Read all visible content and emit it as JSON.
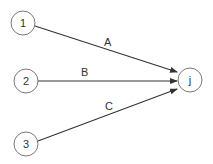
{
  "diagram": {
    "type": "network-activity-diagram",
    "colors": {
      "node_stroke": "#777777",
      "edge": "#333333",
      "text": "#333333",
      "background": "#ffffff"
    },
    "nodes": [
      {
        "id": "1",
        "label": "1",
        "cx": 23,
        "cy": 23,
        "r": 12
      },
      {
        "id": "2",
        "label": "2",
        "cx": 26,
        "cy": 81,
        "r": 12
      },
      {
        "id": "3",
        "label": "3",
        "cx": 26,
        "cy": 144,
        "r": 12
      },
      {
        "id": "j",
        "label": "j",
        "cx": 190,
        "cy": 80,
        "r": 12
      }
    ],
    "edges": [
      {
        "from": "1",
        "to": "j",
        "label": "A",
        "x1": 35,
        "y1": 26,
        "x2": 177,
        "y2": 72,
        "lx": 108,
        "ly": 46
      },
      {
        "from": "2",
        "to": "j",
        "label": "B",
        "x1": 38,
        "y1": 81,
        "x2": 177,
        "y2": 81,
        "lx": 85,
        "ly": 76
      },
      {
        "from": "3",
        "to": "j",
        "label": "C",
        "x1": 38,
        "y1": 141,
        "x2": 177,
        "y2": 89,
        "lx": 109,
        "ly": 108
      }
    ]
  }
}
